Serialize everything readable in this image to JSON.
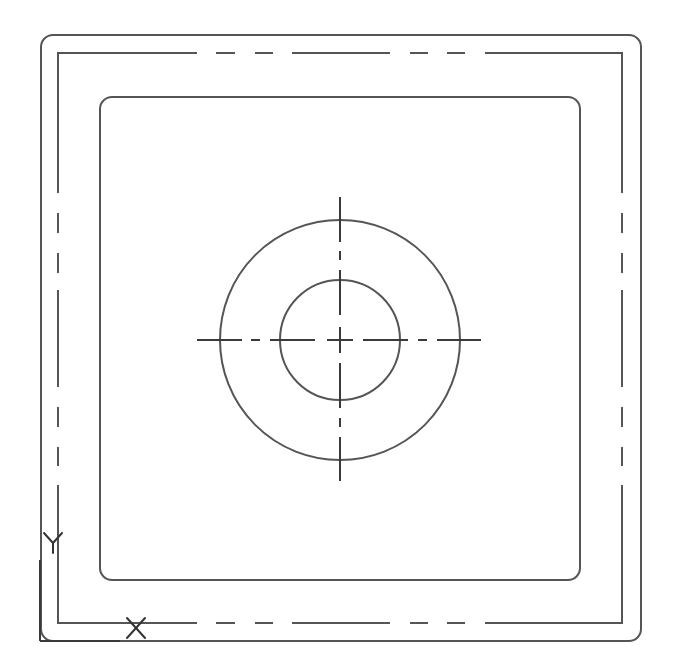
{
  "drawing": {
    "line_color": "#555555",
    "background": "#ffffff",
    "outer_boundary": {
      "x": 41,
      "y": 35,
      "width": 600,
      "height": 606,
      "corner_radius": 12
    },
    "offset_boundary": {
      "x": 57,
      "y": 52,
      "width": 566,
      "height": 571,
      "line_style": "dashed-phantom",
      "segments_along_edge": [
        [
          0,
          140
        ],
        [
          158,
          178
        ],
        [
          198,
          216
        ],
        [
          235,
          333
        ],
        [
          353,
          371
        ],
        [
          390,
          408
        ],
        [
          428,
          566
        ]
      ]
    },
    "inner_boundary": {
      "x": 100,
      "y": 97,
      "width": 480,
      "height": 483,
      "corner_radius": 12
    },
    "hole": {
      "center": [
        340,
        340
      ],
      "outer_circle_radius": 120,
      "inner_circle_radius": 60
    },
    "centerlines": {
      "line_style": "center",
      "extent": [
        197,
        481
      ],
      "segments": [
        [
          197,
          242
        ],
        [
          251,
          260
        ],
        [
          270,
          315
        ],
        [
          327,
          353
        ],
        [
          363,
          408
        ],
        [
          418,
          427
        ],
        [
          437,
          481
        ]
      ]
    }
  },
  "ucs_icon": {
    "origin": [
      40,
      641
    ],
    "x_axis_end": [
      120,
      641
    ],
    "y_axis_end": [
      40,
      560
    ],
    "x_label": "X",
    "y_label": "Y"
  }
}
